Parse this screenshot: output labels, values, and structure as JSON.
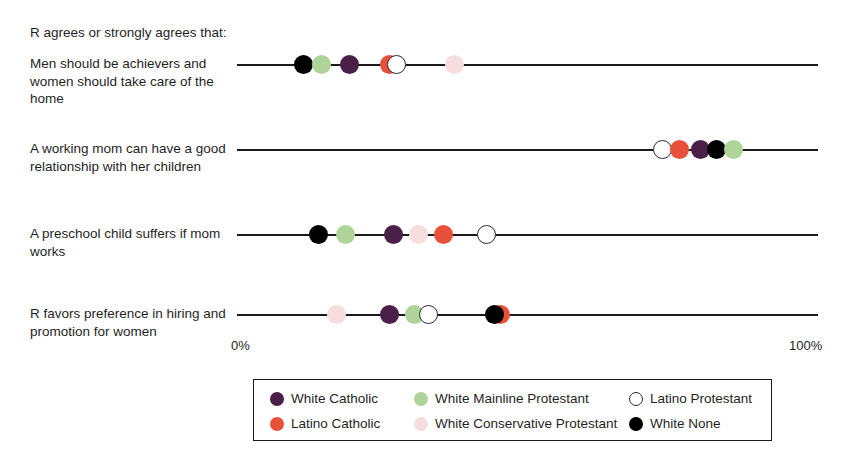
{
  "intro": {
    "text": "R agrees or strongly agrees that:"
  },
  "axis": {
    "min_label": "0%",
    "max_label": "100%",
    "min": 0,
    "max": 100
  },
  "legend": {
    "items": [
      {
        "label": "White Catholic",
        "color": "#4A2049",
        "style": "filled"
      },
      {
        "label": "Latino Catholic",
        "color": "#E8503C",
        "style": "filled"
      },
      {
        "label": "White Mainline Protestant",
        "color": "#AFD49A",
        "style": "filled"
      },
      {
        "label": "White Conservative Protestant",
        "color": "#F7DEDE",
        "style": "filled"
      },
      {
        "label": "Latino Protestant",
        "color": "#FFFFFF",
        "style": "open"
      },
      {
        "label": "White None",
        "color": "#000000",
        "style": "filled"
      }
    ]
  },
  "rows": [
    {
      "label": "Men should be achievers and women should take care of the home",
      "points": [
        {
          "group": "White None",
          "value": 11.4,
          "color": "#000000",
          "style": "filled"
        },
        {
          "group": "White Mainline Protestant",
          "value": 14.6,
          "color": "#AFD49A",
          "style": "filled"
        },
        {
          "group": "White Catholic",
          "value": 19.4,
          "color": "#4A2049",
          "style": "filled"
        },
        {
          "group": "Latino Catholic",
          "value": 26.2,
          "color": "#E8503C",
          "style": "filled"
        },
        {
          "group": "Latino Protestant",
          "value": 27.4,
          "color": "#FFFFFF",
          "style": "open"
        },
        {
          "group": "White Conservative Protestant",
          "value": 37.5,
          "color": "#F7DEDE",
          "style": "filled"
        }
      ]
    },
    {
      "label": "A working mom can have a good relationship with her children",
      "points": [
        {
          "group": "Latino Protestant",
          "value": 73.3,
          "color": "#FFFFFF",
          "style": "open"
        },
        {
          "group": "Latino Catholic",
          "value": 76.1,
          "color": "#E8503C",
          "style": "filled"
        },
        {
          "group": "White Catholic",
          "value": 79.7,
          "color": "#4A2049",
          "style": "filled"
        },
        {
          "group": "White None",
          "value": 82.6,
          "color": "#000000",
          "style": "filled"
        },
        {
          "group": "White Mainline Protestant",
          "value": 85.4,
          "color": "#AFD49A",
          "style": "filled"
        }
      ]
    },
    {
      "label": "A preschool child suffers if mom works",
      "points": [
        {
          "group": "White None",
          "value": 14.1,
          "color": "#000000",
          "style": "filled"
        },
        {
          "group": "White Mainline Protestant",
          "value": 18.6,
          "color": "#AFD49A",
          "style": "filled"
        },
        {
          "group": "White Catholic",
          "value": 26.9,
          "color": "#4A2049",
          "style": "filled"
        },
        {
          "group": "White Conservative Protestant",
          "value": 31.2,
          "color": "#F7DEDE",
          "style": "filled"
        },
        {
          "group": "Latino Catholic",
          "value": 35.5,
          "color": "#E8503C",
          "style": "filled"
        },
        {
          "group": "Latino Protestant",
          "value": 43.0,
          "color": "#FFFFFF",
          "style": "open"
        }
      ]
    },
    {
      "label": "R favors preference in hiring and promotion for women",
      "points": [
        {
          "group": "White Conservative Protestant",
          "value": 17.2,
          "color": "#F7DEDE",
          "style": "filled"
        },
        {
          "group": "White Catholic",
          "value": 26.3,
          "color": "#4A2049",
          "style": "filled"
        },
        {
          "group": "White Mainline Protestant",
          "value": 30.6,
          "color": "#AFD49A",
          "style": "filled"
        },
        {
          "group": "Latino Protestant",
          "value": 33.0,
          "color": "#FFFFFF",
          "style": "open"
        },
        {
          "group": "Latino Catholic",
          "value": 45.3,
          "color": "#E8503C",
          "style": "filled"
        },
        {
          "group": "White None",
          "value": 44.4,
          "color": "#000000",
          "style": "filled"
        }
      ]
    }
  ],
  "chart_data": {
    "type": "scatter",
    "title": "R agrees or strongly agrees that:",
    "xlabel": "",
    "ylabel": "",
    "xlim": [
      0,
      100
    ],
    "xticks": [
      0,
      100
    ],
    "xticklabels": [
      "0%",
      "100%"
    ],
    "grid": false,
    "legend_position": "bottom",
    "categories": [
      "Men should be achievers and women should take care of the home",
      "A working mom can have a good relationship with her children",
      "A preschool child suffers if mom works",
      "R favors preference in hiring and promotion for women"
    ],
    "series": [
      {
        "name": "White Catholic",
        "color": "#4A2049",
        "values": [
          19.4,
          79.7,
          26.9,
          26.3
        ]
      },
      {
        "name": "Latino Catholic",
        "color": "#E8503C",
        "values": [
          26.2,
          76.1,
          35.5,
          45.3
        ]
      },
      {
        "name": "White Mainline Protestant",
        "color": "#AFD49A",
        "values": [
          14.6,
          85.4,
          18.6,
          30.6
        ]
      },
      {
        "name": "White Conservative Protestant",
        "color": "#F7DEDE",
        "values": [
          37.5,
          null,
          31.2,
          17.2
        ]
      },
      {
        "name": "Latino Protestant",
        "color": "#FFFFFF",
        "values": [
          27.4,
          73.3,
          43.0,
          33.0
        ]
      },
      {
        "name": "White None",
        "color": "#000000",
        "values": [
          11.4,
          82.6,
          14.1,
          44.4
        ]
      }
    ]
  }
}
